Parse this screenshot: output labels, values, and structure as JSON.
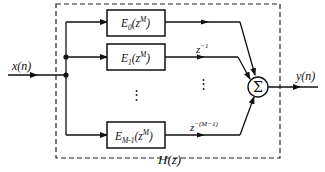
{
  "diagram": {
    "title": "H(z)",
    "input_label": "x(n)",
    "output_label": "y(n)",
    "sum_symbol": "Σ",
    "branches": [
      {
        "filter": {
          "base": "E",
          "sub": "0",
          "arg": "(z",
          "sup": "M",
          "close": ")"
        },
        "delay": {
          "base": "",
          "sup": ""
        }
      },
      {
        "filter": {
          "base": "E",
          "sub": "1",
          "arg": "(z",
          "sup": "M",
          "close": ")"
        },
        "delay": {
          "base": "z",
          "sup": "−1"
        }
      },
      {
        "filter": {
          "base": "E",
          "sub": "M-1",
          "arg": "(z",
          "sup": "M",
          "close": ")"
        },
        "delay": {
          "base": "z",
          "sup": "−(M−1)"
        }
      }
    ],
    "ellipsis_vertical": "⋮",
    "colors": {
      "line": "#111111",
      "background": "#ffffff"
    }
  }
}
